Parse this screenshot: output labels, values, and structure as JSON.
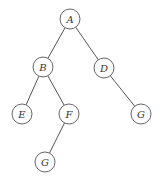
{
  "diagram": {
    "type": "binary-tree",
    "nodes": [
      {
        "id": "A",
        "label": "A",
        "x": 70,
        "y": 19
      },
      {
        "id": "B",
        "label": "B",
        "x": 43,
        "y": 67
      },
      {
        "id": "D",
        "label": "D",
        "x": 104,
        "y": 68
      },
      {
        "id": "E",
        "label": "E",
        "x": 22,
        "y": 114
      },
      {
        "id": "F",
        "label": "F",
        "x": 69,
        "y": 114
      },
      {
        "id": "G1",
        "label": "G",
        "x": 141,
        "y": 114
      },
      {
        "id": "G2",
        "label": "G",
        "x": 45,
        "y": 162
      }
    ],
    "edges": [
      {
        "from": "A",
        "to": "B"
      },
      {
        "from": "A",
        "to": "D"
      },
      {
        "from": "B",
        "to": "E"
      },
      {
        "from": "B",
        "to": "F"
      },
      {
        "from": "D",
        "to": "G1"
      },
      {
        "from": "F",
        "to": "G2"
      }
    ],
    "node_radius": 10
  }
}
